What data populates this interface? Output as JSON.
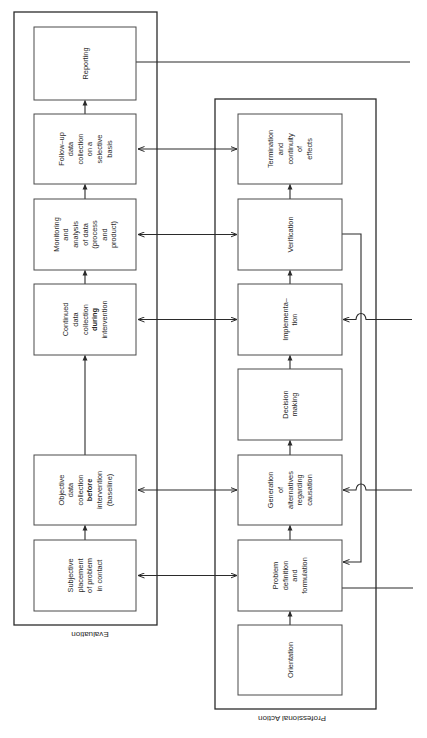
{
  "frames": {
    "evaluation": {
      "label": "Evaluation"
    },
    "professional_action": {
      "label": "Professional Action"
    }
  },
  "evaluation_boxes": [
    {
      "id": "reporting",
      "lines": [
        {
          "t": "Reporting"
        }
      ]
    },
    {
      "id": "follow-up",
      "lines": [
        {
          "t": "Follow–up"
        },
        {
          "t": "data"
        },
        {
          "t": "collection"
        },
        {
          "t": "on a"
        },
        {
          "t": "selective"
        },
        {
          "t": "basis"
        }
      ]
    },
    {
      "id": "monitoring",
      "lines": [
        {
          "t": "Monitoring"
        },
        {
          "t": "and"
        },
        {
          "t": "analysis"
        },
        {
          "t": "of data"
        },
        {
          "t": "(process"
        },
        {
          "t": "and"
        },
        {
          "t": "product)"
        }
      ]
    },
    {
      "id": "continued",
      "lines": [
        {
          "t": "Continued"
        },
        {
          "t": "data"
        },
        {
          "t": "collection"
        },
        {
          "t": "during",
          "b": true
        },
        {
          "t": "intervention"
        }
      ]
    },
    {
      "id": "objective",
      "lines": [
        {
          "t": "Objective"
        },
        {
          "t": "data"
        },
        {
          "t": "collection"
        },
        {
          "t": "before",
          "b": true
        },
        {
          "t": "intervention"
        },
        {
          "t": "(baseline)"
        }
      ]
    },
    {
      "id": "subjective",
      "lines": [
        {
          "t": "Subjective"
        },
        {
          "t": "placement"
        },
        {
          "t": "of problem"
        },
        {
          "t": "in contact"
        }
      ]
    }
  ],
  "professional_boxes": [
    {
      "id": "termination",
      "lines": [
        {
          "t": "Termination"
        },
        {
          "t": "and"
        },
        {
          "t": "continuity"
        },
        {
          "t": "of"
        },
        {
          "t": "effects"
        }
      ]
    },
    {
      "id": "verification",
      "lines": [
        {
          "t": "Verification"
        }
      ]
    },
    {
      "id": "implementation",
      "lines": [
        {
          "t": "Implementa–"
        },
        {
          "t": "tion"
        }
      ]
    },
    {
      "id": "decision",
      "lines": [
        {
          "t": "Decision"
        },
        {
          "t": "making"
        }
      ]
    },
    {
      "id": "generation",
      "lines": [
        {
          "t": "Generation"
        },
        {
          "t": "of"
        },
        {
          "t": "alternatives"
        },
        {
          "t": "regarding"
        },
        {
          "t": "causation"
        }
      ]
    },
    {
      "id": "problem-definition",
      "lines": [
        {
          "t": "Problem"
        },
        {
          "t": "definition"
        },
        {
          "t": "and"
        },
        {
          "t": "formulation"
        }
      ]
    },
    {
      "id": "orientation",
      "lines": [
        {
          "t": "Orientation"
        }
      ]
    }
  ],
  "links": {
    "bidirectional_eval_to_prof": [
      [
        "follow-up",
        "termination"
      ],
      [
        "monitoring",
        "verification"
      ],
      [
        "continued",
        "implementation"
      ],
      [
        "objective",
        "generation"
      ],
      [
        "subjective",
        "problem-definition"
      ]
    ],
    "feedback": [
      "verification",
      "problem-definition"
    ],
    "external_outputs": [
      "reporting",
      "problem-definition"
    ],
    "external_inputs": [
      "implementation",
      "generation"
    ]
  }
}
